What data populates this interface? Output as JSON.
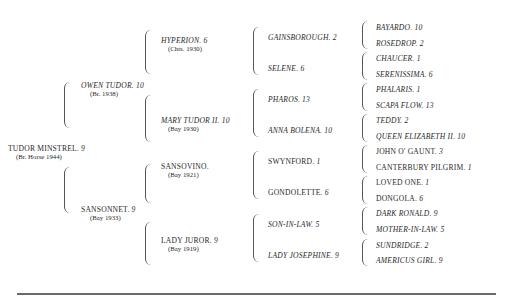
{
  "pedigree": {
    "subject": {
      "name": "TUDOR MINSTREL",
      "num": "9",
      "desc": "(Br. Horse 1944)"
    },
    "gen1": [
      {
        "name": "OWEN TUDOR",
        "num": "10",
        "desc": "(Br. 1938)",
        "italic": true
      },
      {
        "name": "SANSONNET",
        "num": "9",
        "desc": "(Bay 1933)",
        "italic": false
      }
    ],
    "gen2": [
      {
        "name": "HYPERION",
        "num": "6",
        "desc": "(Chts. 1930)",
        "italic": true
      },
      {
        "name": "MARY TUDOR II",
        "num": "10",
        "desc": "(Bay 1930)",
        "italic": true
      },
      {
        "name": "SANSOVINO",
        "num": "",
        "desc": "(Bay 1921)",
        "italic": false
      },
      {
        "name": "LADY JUROR",
        "num": "9",
        "desc": "(Bay 1919)",
        "italic": false
      }
    ],
    "gen3": [
      {
        "name": "GAINSBOROUGH",
        "num": "2",
        "italic": true
      },
      {
        "name": "SELENE",
        "num": "6",
        "italic": true
      },
      {
        "name": "PHAROS",
        "num": "13",
        "italic": true
      },
      {
        "name": "ANNA BOLENA",
        "num": "10",
        "italic": true
      },
      {
        "name": "SWYNFORD",
        "num": "1",
        "italic": false
      },
      {
        "name": "GONDOLETTE",
        "num": "6",
        "italic": false
      },
      {
        "name": "SON-IN-LAW",
        "num": "5",
        "italic": true
      },
      {
        "name": "LADY JOSEPHINE",
        "num": "9",
        "italic": true
      }
    ],
    "gen4": [
      {
        "name": "BAYARDO",
        "num": "10",
        "italic": true
      },
      {
        "name": "ROSEDROP",
        "num": "2",
        "italic": true
      },
      {
        "name": "CHAUCER",
        "num": "1",
        "italic": true
      },
      {
        "name": "SERENISSIMA",
        "num": "6",
        "italic": true
      },
      {
        "name": "PHALARIS",
        "num": "1",
        "italic": true
      },
      {
        "name": "SCAPA FLOW",
        "num": "13",
        "italic": true
      },
      {
        "name": "TEDDY",
        "num": "2",
        "italic": true
      },
      {
        "name": "QUEEN ELIZABETH II",
        "num": "10",
        "italic": true
      },
      {
        "name": "JOHN O' GAUNT",
        "num": "3",
        "italic": false
      },
      {
        "name": "CANTERBURY PILGRIM",
        "num": "1",
        "italic": false
      },
      {
        "name": "LOVED ONE",
        "num": "1",
        "italic": false
      },
      {
        "name": "DONGOLA",
        "num": "6",
        "italic": false
      },
      {
        "name": "DARK RONALD",
        "num": "9",
        "italic": true
      },
      {
        "name": "MOTHER-IN-LAW",
        "num": "5",
        "italic": true
      },
      {
        "name": "SUNDRIDGE",
        "num": "2",
        "italic": true
      },
      {
        "name": "AMERICUS GIRL",
        "num": "9",
        "italic": true
      }
    ]
  }
}
